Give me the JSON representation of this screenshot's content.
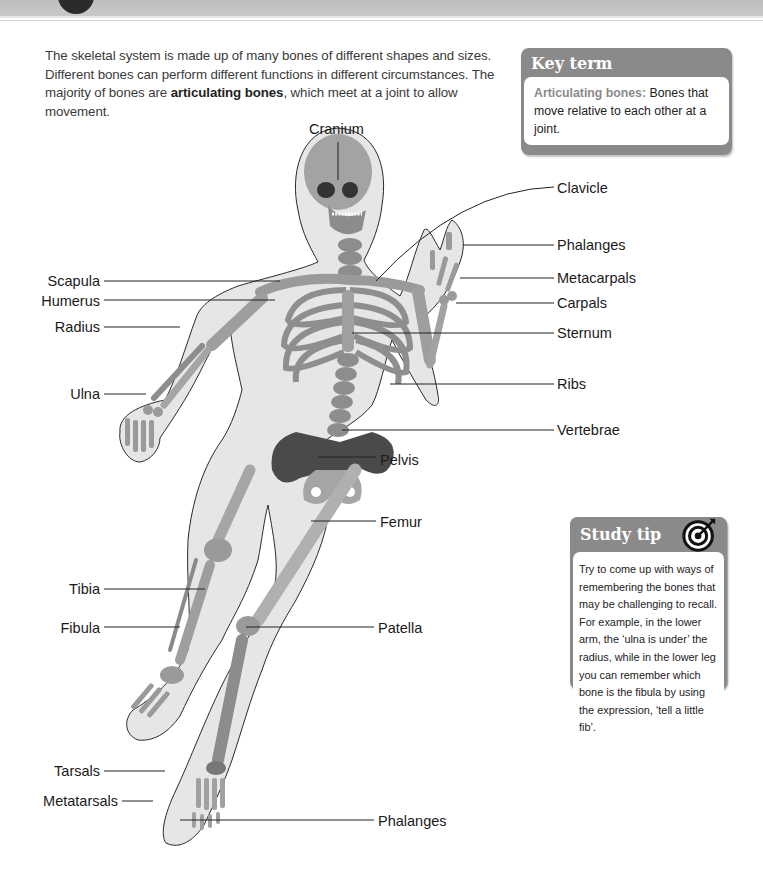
{
  "intro": {
    "text_before": "The skeletal system is made up of many bones of different shapes and sizes. Different bones can perform different functions in different circumstances. The majority of bones are ",
    "bold": "articulating bones",
    "text_after": ", which meet at a joint to allow movement."
  },
  "key_term": {
    "title": "Key term",
    "term": "Articulating bones:",
    "definition": " Bones that move relative to each other at a joint."
  },
  "study_tip": {
    "title": "Study tip",
    "icon": "target-icon",
    "text": "Try to come up with ways of remembering the bones that may be challenging to recall. For example, in the lower arm, the ‘ulna is under’ the radius, while in the lower leg you can remember which bone is the fibula by using the expression, ‘tell a little fib’."
  },
  "diagram": {
    "labels_left": {
      "scapula": "Scapula",
      "humerus": "Humerus",
      "radius": "Radius",
      "ulna": "Ulna",
      "tibia": "Tibia",
      "fibula": "Fibula",
      "tarsals": "Tarsals",
      "metatarsals": "Metatarsals"
    },
    "labels_right": {
      "cranium": "Cranium",
      "clavicle": "Clavicle",
      "phalanges_hand": "Phalanges",
      "metacarpals": "Metacarpals",
      "carpals": "Carpals",
      "sternum": "Sternum",
      "ribs": "Ribs",
      "vertebrae": "Vertebrae",
      "pelvis": "Pelvis",
      "femur": "Femur",
      "patella": "Patella",
      "phalanges_foot": "Phalanges"
    }
  },
  "colors": {
    "callout_header": "#8a8a8a",
    "body_outline": "#e4e4e4",
    "bone": "#9c9c9c",
    "bone_dark": "#555555"
  }
}
